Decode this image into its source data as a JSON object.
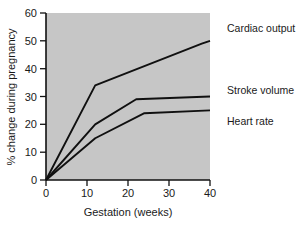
{
  "chart_data": {
    "type": "line",
    "title": "",
    "xlabel": "Gestation (weeks)",
    "ylabel": "% change during pregnancy",
    "xlim": [
      0,
      40
    ],
    "ylim": [
      0,
      60
    ],
    "xticks": [
      0,
      10,
      20,
      30,
      40
    ],
    "yticks": [
      0,
      10,
      20,
      30,
      40,
      50,
      60
    ],
    "xticklabels": [
      "0",
      "10",
      "20",
      "30",
      "40"
    ],
    "yticklabels": [
      "0",
      "10",
      "20",
      "30",
      "40",
      "50",
      "60"
    ],
    "grid": false,
    "legend_position": "right-of-axes-inline",
    "plot_background": "#c6c6c6",
    "line_color": "#101010",
    "series": [
      {
        "name": "Cardiac output",
        "label": "Cardiac output",
        "x": [
          0,
          12,
          38,
          40
        ],
        "values": [
          0,
          34,
          49,
          50
        ]
      },
      {
        "name": "Stroke volume",
        "label": "Stroke volume",
        "x": [
          0,
          12,
          22,
          40
        ],
        "values": [
          0,
          20,
          29,
          30
        ]
      },
      {
        "name": "Heart rate",
        "label": "Heart rate",
        "x": [
          0,
          12,
          24,
          40
        ],
        "values": [
          0,
          15,
          24,
          25
        ]
      }
    ]
  },
  "axes": {
    "x_title": "Gestation (weeks)",
    "y_title": "% change during pregnancy"
  },
  "labels": {
    "cardiac_output": "Cardiac output",
    "stroke_volume": "Stroke volume",
    "heart_rate": "Heart rate"
  }
}
